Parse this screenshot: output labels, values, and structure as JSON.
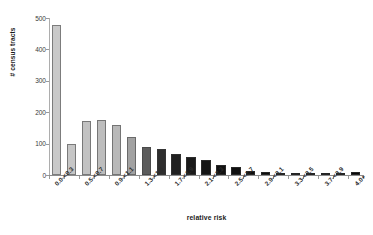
{
  "chart_data": {
    "type": "bar",
    "title": "",
    "xlabel": "relative risk",
    "ylabel": "# census tracts",
    "ylim": [
      0,
      500
    ],
    "yticks": [
      0,
      100,
      200,
      300,
      400,
      500
    ],
    "ytick_labels": [
      "0",
      "100",
      "200",
      "300",
      "400",
      "500"
    ],
    "grid": false,
    "legend": "none",
    "categories": [
      "0.0-<0.3",
      "0.3-<0.5",
      "0.5-<0.7",
      "0.7-<0.9",
      "0.9-<1.1",
      "1.1-<1.3",
      "1.3-<1.5",
      "1.5-<1.7",
      "1.7-<1.9",
      "1.9-<2.1",
      "2.1-<2.3",
      "2.3-<2.5",
      "2.5-<2.7",
      "2.7-<2.9",
      "2.9-<3.1",
      "3.1-<3.3",
      "3.3-<3.5",
      "3.5-<3.7",
      "3.7-<3.9",
      "3.9-<4.0",
      "4.0+"
    ],
    "visible_tick_labels": [
      "0.0-<0.3",
      "0.5-<0.7",
      "0.9-<1.1",
      "1.3-<1.5",
      "1.7-<1.9",
      "2.1-<2.3",
      "2.5-<2.7",
      "2.9-<3.1",
      "3.3-<3.5",
      "3.7-<3.9",
      "4.0+"
    ],
    "visible_tick_indices": [
      0,
      2,
      4,
      6,
      8,
      10,
      12,
      14,
      16,
      18,
      20
    ],
    "values": [
      478,
      100,
      172,
      175,
      158,
      120,
      88,
      82,
      68,
      58,
      48,
      33,
      25,
      12,
      10,
      8,
      7,
      6,
      5,
      4,
      9
    ],
    "bar_colors": [
      "#c9c9c9",
      "#c6c6c6",
      "#c2c2c2",
      "#bdbdbd",
      "#b8b8b8",
      "#a2a2a2",
      "#5c5c5c",
      "#2e2e2e",
      "#202020",
      "#1a1a1a",
      "#141414",
      "#111111",
      "#101010",
      "#0e0e0e",
      "#0d0d0d",
      "#0c0c0c",
      "#0b0b0b",
      "#0a0a0a",
      "#0a0a0a",
      "#090909",
      "#080808"
    ]
  },
  "axis": {
    "y_title": "# census tracts",
    "x_title": "relative risk"
  },
  "colors": {
    "background": "#ffffff",
    "axis_line": "#9a9a9a",
    "tick_text": "#3a3a3a",
    "title_text": "#1a1a1a"
  }
}
